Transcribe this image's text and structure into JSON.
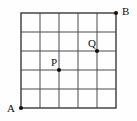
{
  "figure": {
    "background_color": "#fefefe",
    "grid": {
      "columns": 5,
      "rows": 5,
      "cell_size_px": 19,
      "origin_x_px": 21,
      "origin_y_px": 13,
      "width_px": 95,
      "height_px": 95,
      "line_color": "#4a4a4a",
      "line_width_px": 1,
      "border_color": "#3a3a3a",
      "border_width_px": 1.4
    },
    "points": [
      {
        "id": "A",
        "label": "A",
        "grid_col": 0,
        "grid_row": 0,
        "x_px": 21,
        "y_px": 108,
        "label_x_px": 7,
        "label_y_px": 103,
        "dot_radius_px": 2.1,
        "color": "#101010"
      },
      {
        "id": "B",
        "label": "B",
        "grid_col": 5,
        "grid_row": 5,
        "x_px": 116,
        "y_px": 13,
        "label_x_px": 122,
        "label_y_px": 6,
        "dot_radius_px": 2.1,
        "color": "#101010"
      },
      {
        "id": "P",
        "label": "P",
        "grid_col": 2,
        "grid_row": 2,
        "x_px": 59,
        "y_px": 70,
        "label_x_px": 51,
        "label_y_px": 57,
        "dot_radius_px": 2.1,
        "color": "#101010"
      },
      {
        "id": "Q",
        "label": "Q",
        "grid_col": 4,
        "grid_row": 3,
        "x_px": 97,
        "y_px": 51,
        "label_x_px": 88,
        "label_y_px": 38,
        "dot_radius_px": 2.1,
        "color": "#101010"
      }
    ]
  },
  "chart_data": {
    "type": "scatter",
    "title": "",
    "xlabel": "",
    "ylabel": "",
    "xlim": [
      0,
      5
    ],
    "ylim": [
      0,
      5
    ],
    "grid": true,
    "legend": "none",
    "categories": [
      "A",
      "B",
      "P",
      "Q"
    ],
    "series": [
      {
        "name": "labeled lattice points",
        "points": [
          {
            "label": "A",
            "x": 0,
            "y": 0
          },
          {
            "label": "B",
            "x": 5,
            "y": 5
          },
          {
            "label": "P",
            "x": 2,
            "y": 2
          },
          {
            "label": "Q",
            "x": 4,
            "y": 3
          }
        ]
      }
    ]
  }
}
